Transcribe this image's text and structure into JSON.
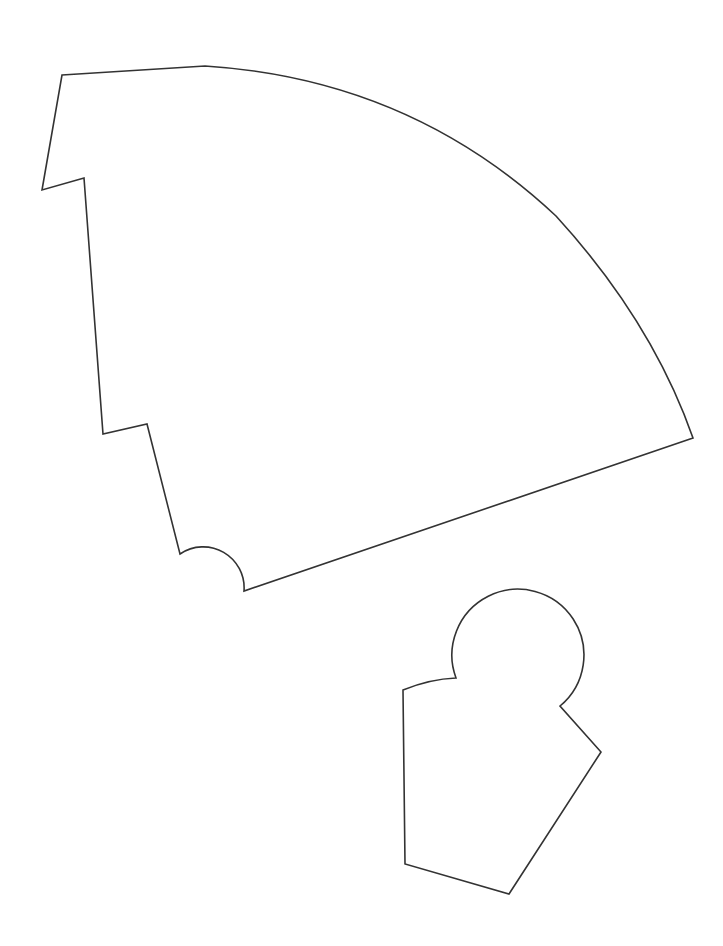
{
  "document": {
    "kind": "technical-outline-drawing",
    "background_color": "#ffffff",
    "stroke_color": "#333333",
    "stroke_width": 1.6,
    "canvas_width": 723,
    "canvas_height": 946,
    "clipped_caption": "",
    "shape_count": 2
  },
  "shapes": {
    "fan": {
      "name": "large-fan-sector-part",
      "label": "",
      "bbox": {
        "x": 42,
        "y": 64,
        "width": 651,
        "height": 527
      },
      "path": "M 62 75 L 205 66 Q 410 79 556 216 Q 652 321 693 438 L 244 591 A 41 41 0 0 0 180 554 L 147 424 L 103 434 L 84 178 L 42 190 Z",
      "features": [
        "outer-arc-top-right",
        "left-notch-upper",
        "left-notch-lower",
        "bottom-semicircular-cutout",
        "straight-bottom-edge"
      ]
    },
    "knob": {
      "name": "small-knob-part",
      "label": "",
      "bbox": {
        "x": 403,
        "y": 577,
        "width": 199,
        "height": 318
      },
      "path": "M 403 690 Q 430 679 456 678 A 66 66 0 1 1 560 706 L 601 752 L 509 894 L 405 864 Z",
      "features": [
        "circular-head",
        "left-vertical-edge",
        "right-v-notch",
        "bottom-point"
      ]
    }
  }
}
